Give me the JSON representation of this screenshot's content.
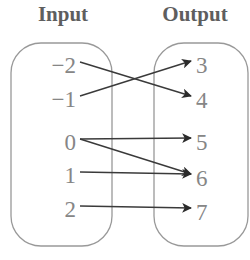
{
  "diagram": {
    "title_left": "Input",
    "title_right": "Output",
    "type": "function-mapping-diagram",
    "stroke_color": "#3a3a3a",
    "oval_color": "#999999",
    "label_color": "#868686",
    "header_color": "#5e5e5e",
    "inputs": [
      {
        "label": "−2",
        "y": 68
      },
      {
        "label": "−1",
        "y": 102
      },
      {
        "label": "0",
        "y": 145
      },
      {
        "label": "1",
        "y": 178
      },
      {
        "label": "2",
        "y": 212
      }
    ],
    "outputs": [
      {
        "label": "3",
        "y": 68
      },
      {
        "label": "4",
        "y": 103
      },
      {
        "label": "5",
        "y": 145
      },
      {
        "label": "6",
        "y": 181
      },
      {
        "label": "7",
        "y": 215
      }
    ],
    "mappings": [
      {
        "from": "−2",
        "to": "4"
      },
      {
        "from": "−1",
        "to": "3"
      },
      {
        "from": "0",
        "to": "5"
      },
      {
        "from": "0",
        "to": "6"
      },
      {
        "from": "1",
        "to": "6"
      },
      {
        "from": "2",
        "to": "7"
      }
    ]
  }
}
